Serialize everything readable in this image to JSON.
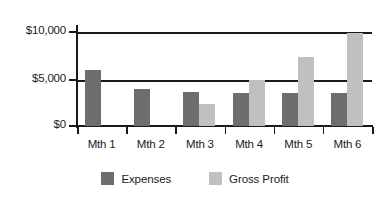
{
  "chart_data": {
    "type": "bar",
    "title": "",
    "subtitle": "",
    "xlabel": "",
    "ylabel": "",
    "categories": [
      "Mth 1",
      "Mth 2",
      "Mth 3",
      "Mth 4",
      "Mth 5",
      "Mth 6"
    ],
    "series": [
      {
        "name": "Expenses",
        "color": "#6e6e6e",
        "values": [
          6000,
          4000,
          3700,
          3600,
          3600,
          3600
        ]
      },
      {
        "name": "Gross Profit",
        "color": "#c0c0c0",
        "values": [
          0,
          0,
          2400,
          5000,
          7500,
          10000
        ]
      }
    ],
    "ylim": [
      0,
      10800
    ],
    "yticks": [
      0,
      5000,
      10000
    ],
    "ytick_labels": [
      "$0",
      "$5,000",
      "$10,000"
    ],
    "grid": true,
    "grid_axis": "y",
    "legend_position": "bottom"
  },
  "axis": {
    "y": {
      "tick_0": "$0",
      "tick_5000": "$5,000",
      "tick_10000": "$10,000"
    }
  },
  "legend": {
    "items": [
      {
        "label": "Expenses",
        "color": "#6e6e6e"
      },
      {
        "label": "Gross Profit",
        "color": "#c0c0c0"
      }
    ]
  },
  "colors": {
    "expenses": "#6e6e6e",
    "gross_profit": "#c0c0c0",
    "axis": "#1a1a1a",
    "background": "#ffffff"
  }
}
